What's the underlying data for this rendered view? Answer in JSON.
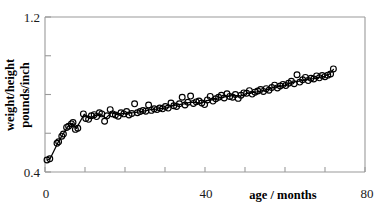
{
  "chart_data": {
    "type": "scatter",
    "title": "",
    "xlabel": "age / months",
    "ylabel": "weight/height pounds/inch",
    "ylabel_line1": "weight/height",
    "ylabel_line2": "pounds/inch",
    "xlim": [
      0,
      80
    ],
    "ylim": [
      0.4,
      1.2
    ],
    "xticks": [
      0,
      10,
      20,
      30,
      40,
      50,
      60,
      70,
      80
    ],
    "xtick_labels": [
      "0",
      "",
      "",
      "",
      "40",
      "",
      "",
      "",
      "80"
    ],
    "yticks": [
      0.4,
      0.6,
      0.8,
      1.0,
      1.2
    ],
    "ytick_labels": [
      "0.4",
      "",
      "",
      "",
      "1.2"
    ],
    "grid": false,
    "legend": "none",
    "marker": "open-circle",
    "marker_color": "#000000",
    "line_color": "#000000",
    "series": [
      {
        "name": "observations",
        "type": "scatter",
        "points": [
          [
            0.5,
            0.462
          ],
          [
            1.2,
            0.468
          ],
          [
            3.0,
            0.548
          ],
          [
            3.4,
            0.556
          ],
          [
            4.2,
            0.585
          ],
          [
            4.6,
            0.596
          ],
          [
            5.4,
            0.63
          ],
          [
            5.9,
            0.636
          ],
          [
            6.6,
            0.648
          ],
          [
            7.0,
            0.655
          ],
          [
            7.6,
            0.62
          ],
          [
            8.2,
            0.626
          ],
          [
            9.6,
            0.7
          ],
          [
            10.2,
            0.676
          ],
          [
            10.9,
            0.672
          ],
          [
            11.6,
            0.69
          ],
          [
            12.3,
            0.696
          ],
          [
            12.9,
            0.686
          ],
          [
            13.6,
            0.706
          ],
          [
            14.2,
            0.7
          ],
          [
            14.9,
            0.662
          ],
          [
            15.5,
            0.69
          ],
          [
            16.3,
            0.722
          ],
          [
            16.9,
            0.7
          ],
          [
            17.6,
            0.694
          ],
          [
            18.3,
            0.688
          ],
          [
            19.0,
            0.706
          ],
          [
            19.7,
            0.7
          ],
          [
            20.4,
            0.712
          ],
          [
            21.0,
            0.694
          ],
          [
            21.7,
            0.702
          ],
          [
            22.4,
            0.752
          ],
          [
            23.1,
            0.706
          ],
          [
            23.8,
            0.712
          ],
          [
            24.5,
            0.718
          ],
          [
            25.2,
            0.714
          ],
          [
            25.9,
            0.746
          ],
          [
            26.6,
            0.718
          ],
          [
            27.3,
            0.726
          ],
          [
            28.0,
            0.722
          ],
          [
            28.7,
            0.73
          ],
          [
            29.4,
            0.726
          ],
          [
            30.1,
            0.738
          ],
          [
            30.8,
            0.73
          ],
          [
            31.5,
            0.756
          ],
          [
            32.2,
            0.742
          ],
          [
            32.9,
            0.738
          ],
          [
            33.6,
            0.752
          ],
          [
            34.3,
            0.786
          ],
          [
            35.0,
            0.746
          ],
          [
            35.7,
            0.76
          ],
          [
            36.4,
            0.792
          ],
          [
            37.1,
            0.754
          ],
          [
            37.8,
            0.762
          ],
          [
            38.5,
            0.766
          ],
          [
            39.2,
            0.756
          ],
          [
            39.9,
            0.748
          ],
          [
            40.6,
            0.772
          ],
          [
            41.3,
            0.79
          ],
          [
            42.0,
            0.766
          ],
          [
            42.7,
            0.778
          ],
          [
            43.4,
            0.786
          ],
          [
            44.1,
            0.796
          ],
          [
            44.8,
            0.782
          ],
          [
            45.5,
            0.804
          ],
          [
            46.2,
            0.79
          ],
          [
            46.9,
            0.786
          ],
          [
            47.6,
            0.8
          ],
          [
            48.3,
            0.78
          ],
          [
            49.0,
            0.796
          ],
          [
            49.7,
            0.808
          ],
          [
            50.4,
            0.806
          ],
          [
            51.1,
            0.82
          ],
          [
            51.8,
            0.802
          ],
          [
            52.5,
            0.812
          ],
          [
            53.2,
            0.818
          ],
          [
            53.9,
            0.826
          ],
          [
            54.6,
            0.816
          ],
          [
            55.3,
            0.83
          ],
          [
            56.0,
            0.822
          ],
          [
            56.7,
            0.836
          ],
          [
            57.4,
            0.848
          ],
          [
            58.1,
            0.834
          ],
          [
            58.8,
            0.844
          ],
          [
            59.5,
            0.852
          ],
          [
            60.2,
            0.846
          ],
          [
            60.9,
            0.858
          ],
          [
            61.6,
            0.868
          ],
          [
            62.3,
            0.856
          ],
          [
            63.0,
            0.902
          ],
          [
            63.7,
            0.864
          ],
          [
            64.4,
            0.876
          ],
          [
            65.1,
            0.888
          ],
          [
            65.8,
            0.872
          ],
          [
            66.5,
            0.884
          ],
          [
            67.2,
            0.88
          ],
          [
            67.9,
            0.896
          ],
          [
            68.6,
            0.886
          ],
          [
            69.3,
            0.898
          ],
          [
            70.0,
            0.892
          ],
          [
            70.7,
            0.9
          ],
          [
            71.4,
            0.906
          ],
          [
            72.1,
            0.932
          ]
        ]
      },
      {
        "name": "trend",
        "type": "line",
        "points": [
          [
            0.6,
            0.462
          ],
          [
            1.3,
            0.47
          ],
          [
            3.2,
            0.55
          ],
          [
            4.4,
            0.592
          ],
          [
            5.6,
            0.632
          ],
          [
            6.8,
            0.652
          ],
          [
            7.8,
            0.624
          ],
          [
            9.8,
            0.698
          ],
          [
            11.0,
            0.676
          ],
          [
            12.4,
            0.69
          ],
          [
            13.8,
            0.7
          ],
          [
            15.2,
            0.678
          ],
          [
            16.6,
            0.706
          ],
          [
            18.0,
            0.696
          ],
          [
            19.4,
            0.702
          ],
          [
            20.8,
            0.704
          ],
          [
            22.2,
            0.706
          ],
          [
            23.6,
            0.71
          ],
          [
            25.0,
            0.716
          ],
          [
            26.4,
            0.722
          ],
          [
            27.8,
            0.724
          ],
          [
            29.2,
            0.728
          ],
          [
            30.6,
            0.732
          ],
          [
            32.0,
            0.742
          ],
          [
            33.4,
            0.748
          ],
          [
            34.8,
            0.752
          ],
          [
            36.2,
            0.76
          ],
          [
            37.6,
            0.76
          ],
          [
            39.0,
            0.756
          ],
          [
            40.4,
            0.768
          ],
          [
            41.8,
            0.772
          ],
          [
            43.2,
            0.782
          ],
          [
            44.6,
            0.786
          ],
          [
            46.0,
            0.792
          ],
          [
            47.4,
            0.796
          ],
          [
            48.8,
            0.792
          ],
          [
            50.2,
            0.804
          ],
          [
            51.6,
            0.81
          ],
          [
            53.0,
            0.814
          ],
          [
            54.4,
            0.82
          ],
          [
            55.8,
            0.826
          ],
          [
            57.2,
            0.838
          ],
          [
            58.6,
            0.842
          ],
          [
            60.0,
            0.848
          ],
          [
            61.4,
            0.86
          ],
          [
            62.8,
            0.866
          ],
          [
            64.2,
            0.872
          ],
          [
            65.6,
            0.878
          ],
          [
            67.0,
            0.882
          ],
          [
            68.4,
            0.888
          ],
          [
            69.8,
            0.894
          ],
          [
            71.2,
            0.906
          ],
          [
            72.1,
            0.93
          ]
        ]
      }
    ]
  },
  "axes": {
    "x_title": "age / months",
    "y_title_line1": "weight/height",
    "y_title_line2": "pounds/inch",
    "x_label_min": "0",
    "x_label_mid": "40",
    "x_label_max": "80",
    "y_label_min": "0.4",
    "y_label_max": "1.2"
  },
  "style": {
    "axis_color": "#9a9a9a",
    "marker_color": "#000000",
    "line_color": "#000000",
    "text_color": "#1a1a1a",
    "background": "#ffffff"
  }
}
